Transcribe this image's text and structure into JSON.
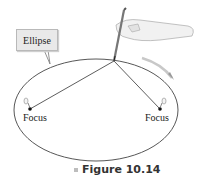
{
  "figure": {
    "callout_label": "Ellipse",
    "focus_left_label": "Focus",
    "focus_right_label": "Focus",
    "caption": "Figure 10.14"
  },
  "colors": {
    "line": "#333333",
    "callout_bg": "#e9e9e9",
    "arrow": "#9a9a9a"
  }
}
